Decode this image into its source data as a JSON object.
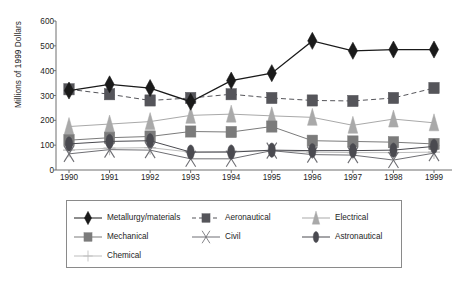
{
  "chart_data": {
    "type": "line",
    "title": "",
    "xlabel": "",
    "ylabel": "Millions of 1999 Dollars",
    "categories": [
      "1990",
      "1991",
      "1992",
      "1993",
      "1994",
      "1995",
      "1996",
      "1997",
      "1998",
      "1999"
    ],
    "x": [
      1990,
      1991,
      1992,
      1993,
      1994,
      1995,
      1996,
      1997,
      1998,
      1999
    ],
    "ylim": [
      0,
      600
    ],
    "yticks": [
      0,
      100,
      200,
      300,
      400,
      500,
      600
    ],
    "grid": false,
    "legend_position": "bottom",
    "series": [
      {
        "name": "Metallurgy/materials",
        "marker": "diamond",
        "color": "#1a1a1a",
        "line_style": "solid",
        "values": [
          320,
          345,
          330,
          275,
          360,
          390,
          520,
          480,
          485,
          485
        ]
      },
      {
        "name": "Aeronautical",
        "marker": "square",
        "color": "#55555a",
        "line_style": "dashed",
        "values": [
          325,
          305,
          280,
          290,
          305,
          290,
          280,
          278,
          290,
          330
        ]
      },
      {
        "name": "Electrical",
        "marker": "triangle",
        "color": "#a9a9a9",
        "line_style": "solid",
        "values": [
          175,
          185,
          195,
          220,
          225,
          218,
          212,
          180,
          205,
          190
        ]
      },
      {
        "name": "Mechanical",
        "marker": "square",
        "color": "#7b7b7b",
        "line_style": "solid",
        "values": [
          120,
          130,
          135,
          155,
          153,
          175,
          118,
          115,
          112,
          105
        ]
      },
      {
        "name": "Civil",
        "marker": "x",
        "color": "#6f6f74",
        "line_style": "solid",
        "values": [
          65,
          82,
          80,
          45,
          45,
          78,
          62,
          60,
          40,
          68
        ]
      },
      {
        "name": "Astronautical",
        "marker": "ellipse",
        "color": "#4a4a50",
        "line_style": "solid",
        "values": [
          105,
          115,
          118,
          72,
          72,
          80,
          78,
          78,
          80,
          95
        ]
      },
      {
        "name": "Chemical",
        "marker": "plus",
        "color": "#bdbdbd",
        "line_style": "solid",
        "values": [
          80,
          88,
          90,
          72,
          75,
          78,
          72,
          70,
          70,
          72
        ]
      }
    ]
  },
  "axes": {
    "y_label": "Millions of 1999 Dollars",
    "y_ticks": [
      "600",
      "500",
      "400",
      "300",
      "200",
      "100",
      "0"
    ],
    "x_ticks": [
      "1990",
      "1991",
      "1992",
      "1993",
      "1994",
      "1995",
      "1996",
      "1997",
      "1998",
      "1999"
    ]
  },
  "legend": {
    "items": [
      {
        "label": "Metallurgy/materials",
        "marker": "diamond-icon",
        "color": "#1a1a1a",
        "line_style": "solid"
      },
      {
        "label": "Aeronautical",
        "marker": "square-icon",
        "color": "#55555a",
        "line_style": "dashed"
      },
      {
        "label": "Electrical",
        "marker": "triangle-icon",
        "color": "#a9a9a9",
        "line_style": "solid"
      },
      {
        "label": "Mechanical",
        "marker": "square-icon",
        "color": "#7b7b7b",
        "line_style": "solid"
      },
      {
        "label": "Civil",
        "marker": "x-icon",
        "color": "#6f6f74",
        "line_style": "solid"
      },
      {
        "label": "Astronautical",
        "marker": "ellipse-icon",
        "color": "#4a4a50",
        "line_style": "solid"
      },
      {
        "label": "Chemical",
        "marker": "plus-icon",
        "color": "#bdbdbd",
        "line_style": "solid"
      }
    ]
  }
}
